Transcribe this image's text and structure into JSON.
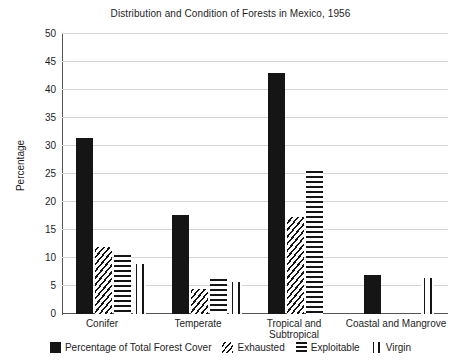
{
  "chart_data": {
    "type": "bar",
    "title": "Distribution and Condition of Forests in Mexico, 1956",
    "xlabel": "",
    "ylabel": "Percentage",
    "ylim": [
      0,
      50
    ],
    "yticks": [
      0,
      5,
      10,
      15,
      20,
      25,
      30,
      35,
      40,
      45,
      50
    ],
    "grid": true,
    "legend_position": "bottom",
    "categories": [
      "Conifer",
      "Temperate",
      "Tropical and Subtropical",
      "Coastal and Mangrove"
    ],
    "series": [
      {
        "name": "Percentage of Total Forest Cover",
        "pattern": "solid",
        "values": [
          31.5,
          17.7,
          43.0,
          7.0
        ]
      },
      {
        "name": "Exhausted",
        "pattern": "diagonal-hatch",
        "values": [
          12.0,
          4.5,
          17.3,
          null
        ]
      },
      {
        "name": "Exploitable",
        "pattern": "horizontal-lines",
        "values": [
          10.5,
          6.3,
          25.5,
          null
        ]
      },
      {
        "name": "Virgin",
        "pattern": "vertical-lines",
        "values": [
          9.0,
          5.8,
          null,
          6.5
        ]
      }
    ]
  },
  "axis": {
    "y_label": "Percentage",
    "tick_50": "50",
    "tick_45": "45",
    "tick_40": "40",
    "tick_35": "35",
    "tick_30": "30",
    "tick_25": "25",
    "tick_20": "20",
    "tick_15": "15",
    "tick_10": "10",
    "tick_5": "5",
    "tick_0": "0"
  },
  "categories_text": {
    "c0": "Conifer",
    "c1": "Temperate",
    "c2_line1": "Tropical and",
    "c2_line2": "Subtropical",
    "c3": "Coastal and Mangrove"
  },
  "legend": {
    "s0": "Percentage of Total Forest Cover",
    "s1": "Exhausted",
    "s2": "Exploitable",
    "s3": "Virgin"
  },
  "colors": {
    "ink": "#151515",
    "gridline": "#d6d6d6",
    "axis": "#555555",
    "background": "#ffffff"
  }
}
